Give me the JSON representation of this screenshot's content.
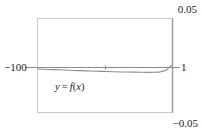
{
  "figure": {
    "kind": "graphing-calculator-viewing-window",
    "background_color": "#ffffff",
    "frame_color": "#c9c9c9",
    "axis_color": "#8c8c8c",
    "curve_color": "#8c8c8c",
    "text_color": "#1a1a1a"
  },
  "labels": {
    "y_max": "0.05",
    "y_min": "−0.05",
    "x_min": "−100",
    "x_max": "1",
    "curve_var_y": "y",
    "curve_equals": " = ",
    "curve_fn": "f",
    "curve_arg_open": "(",
    "curve_arg": "x",
    "curve_arg_close": ")"
  },
  "chart_data": {
    "type": "line",
    "title": "",
    "xlabel": "",
    "ylabel": "",
    "xlim": [
      -100,
      1
    ],
    "ylim": [
      -0.05,
      0.05
    ],
    "grid": false,
    "legend": "none",
    "annotations": [
      {
        "text": "y = f(x)",
        "x": -62,
        "y": -0.018
      }
    ],
    "axis_lines": [
      {
        "orientation": "horizontal",
        "value": 0,
        "label_left": "−100",
        "label_right": "1"
      }
    ],
    "ticks": {
      "x": [
        {
          "value": -32,
          "label": ""
        }
      ],
      "y": [
        {
          "value": 0.05,
          "label": "0.05"
        },
        {
          "value": -0.05,
          "label": "−0.05"
        }
      ]
    },
    "series": [
      {
        "name": "y = f(x)",
        "color": "#8c8c8c",
        "points": [
          {
            "x": -100,
            "y": -0.0037
          },
          {
            "x": -92,
            "y": -0.0042
          },
          {
            "x": -84,
            "y": -0.0046
          },
          {
            "x": -76,
            "y": -0.0051
          },
          {
            "x": -68,
            "y": -0.0055
          },
          {
            "x": -60,
            "y": -0.0059
          },
          {
            "x": -52,
            "y": -0.0063
          },
          {
            "x": -44,
            "y": -0.0066
          },
          {
            "x": -36,
            "y": -0.0069
          },
          {
            "x": -28,
            "y": -0.0071
          },
          {
            "x": -22,
            "y": -0.0072
          },
          {
            "x": -17,
            "y": -0.0073
          },
          {
            "x": -13,
            "y": -0.0072
          },
          {
            "x": -10,
            "y": -0.007
          },
          {
            "x": -7.5,
            "y": -0.0066
          },
          {
            "x": -5.5,
            "y": -0.0059
          },
          {
            "x": -4,
            "y": -0.005
          },
          {
            "x": -3,
            "y": -0.004
          },
          {
            "x": -2,
            "y": -0.0028
          },
          {
            "x": -1.2,
            "y": -0.0016
          },
          {
            "x": -0.5,
            "y": -0.0006
          },
          {
            "x": 0,
            "y": -0.0001
          },
          {
            "x": 1,
            "y": 0
          }
        ],
        "minimum": {
          "x": -17,
          "y": -0.0073
        }
      }
    ]
  }
}
